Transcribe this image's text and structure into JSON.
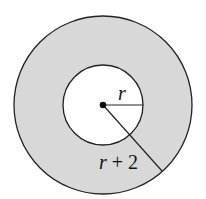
{
  "diagram": {
    "type": "annulus",
    "colors": {
      "ring_fill": "#d8d8d8",
      "inner_fill": "#ffffff",
      "stroke": "#222222"
    },
    "outer_circle": {
      "cx": 103,
      "cy": 105,
      "r": 89
    },
    "inner_circle": {
      "cx": 103,
      "cy": 105,
      "r": 40
    },
    "labels": {
      "inner_radius": "r",
      "outer_radius": "r + 2"
    }
  }
}
